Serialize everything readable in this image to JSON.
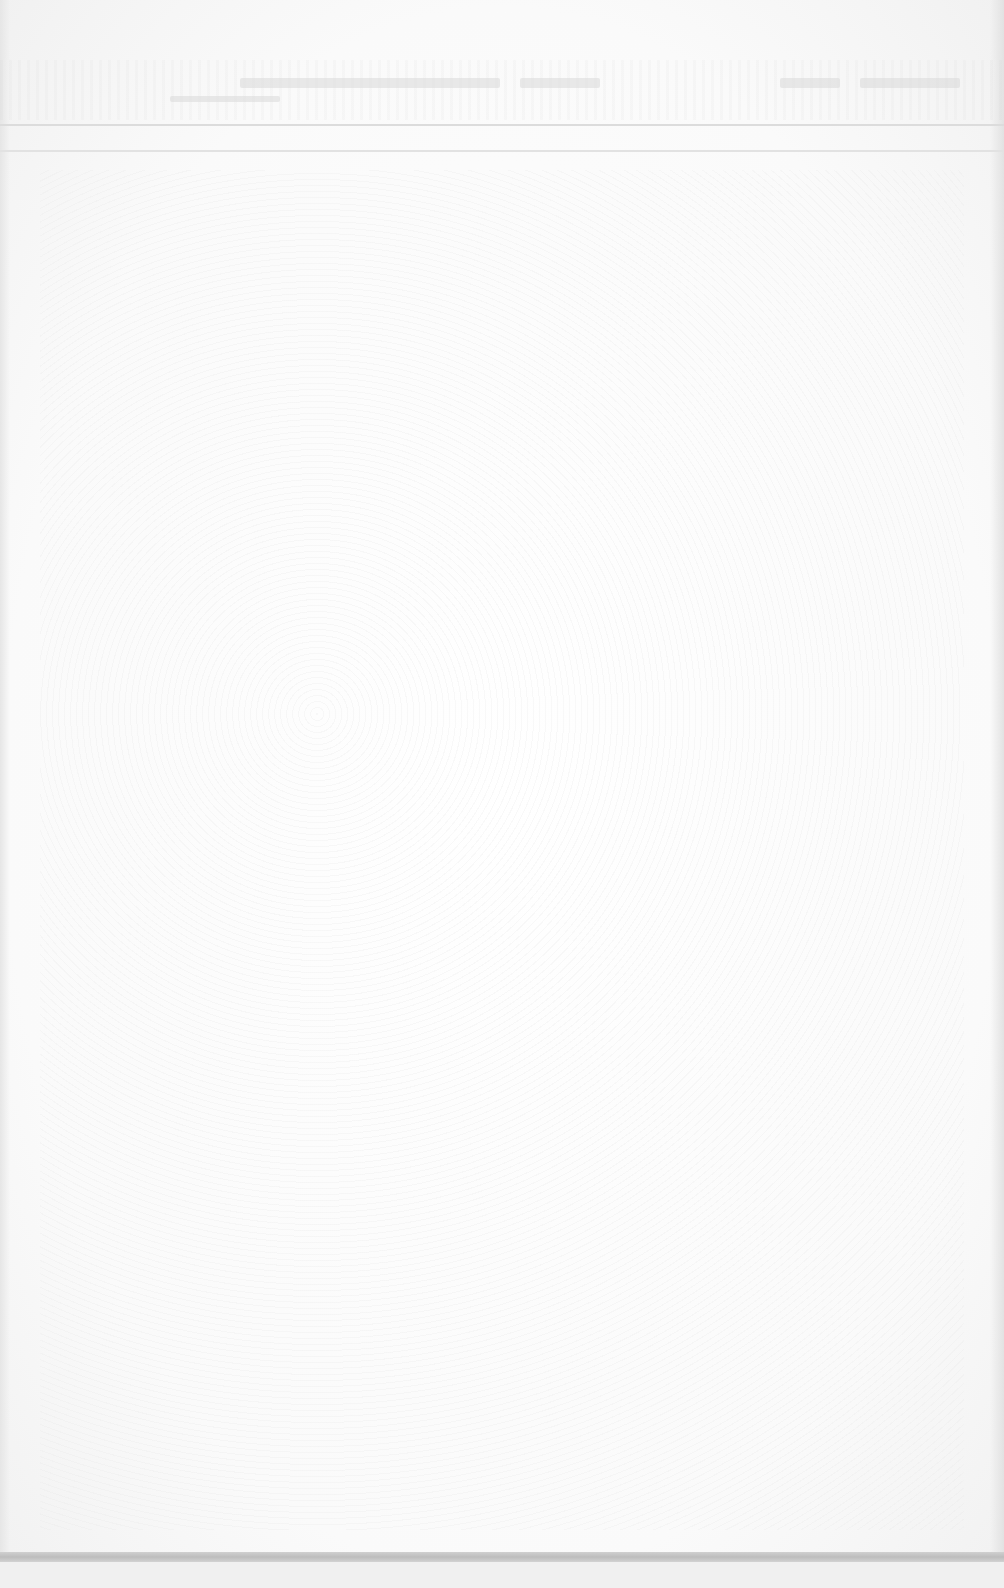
{
  "document": {
    "type": "scanned-page",
    "background_color": "#fbfbfb",
    "legible_text": [],
    "header": {
      "has_faint_marks": true,
      "rules_y": [
        125,
        150
      ]
    },
    "footer": {
      "band_y": 1557,
      "band_color": "#c4c4c4"
    }
  }
}
